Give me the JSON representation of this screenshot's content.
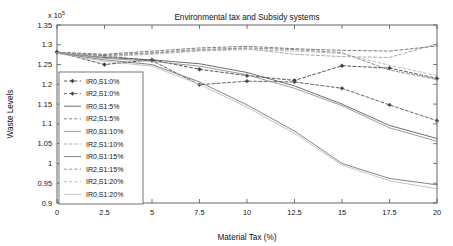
{
  "chart_data": {
    "type": "line",
    "title": "Environmental tax and Subsidy systems",
    "xlabel": "Material Tax (%)",
    "ylabel": "Waste Levels",
    "y_exponent_label": "x 10",
    "y_exponent_power": "5",
    "grid": false,
    "legend_position": "left-middle",
    "xlim": [
      0,
      20
    ],
    "ylim": [
      0.9,
      1.35
    ],
    "xticks": [
      0,
      2.5,
      5,
      7.5,
      10,
      12.5,
      15,
      17.5,
      20
    ],
    "xticklabels": [
      "0",
      "2.5",
      "5",
      "7.5",
      "10",
      "12.5",
      "15",
      "17.5",
      "20"
    ],
    "yticks": [
      0.9,
      0.95,
      1,
      1.05,
      1.1,
      1.15,
      1.2,
      1.25,
      1.3,
      1.35
    ],
    "yticklabels": [
      "0.9",
      "0.95",
      "1",
      "1.05",
      "1.1",
      "1.15",
      "1.2",
      "1.25",
      "1.3",
      "1.35"
    ],
    "x": [
      0,
      2.5,
      5,
      7.5,
      10,
      12.5,
      15,
      17.5,
      20
    ],
    "series": [
      {
        "name": "IR0,S1:0%",
        "style": "dashed-marker",
        "marker": "diamond",
        "color": "#3a3a3a",
        "values": [
          1.282,
          1.25,
          1.262,
          1.238,
          1.222,
          1.21,
          1.247,
          1.241,
          1.215
        ]
      },
      {
        "name": "IR2,S1:0%",
        "style": "dashed-marker",
        "marker": "diamond",
        "color": "#4a4a4a",
        "values": [
          1.281,
          1.272,
          1.26,
          1.199,
          1.208,
          1.206,
          1.19,
          1.148,
          1.108
        ]
      },
      {
        "name": "IR0,S1:5%",
        "style": "solid",
        "marker": "none",
        "color": "#555555",
        "values": [
          1.28,
          1.268,
          1.262,
          1.252,
          1.23,
          1.196,
          1.15,
          1.096,
          1.063
        ]
      },
      {
        "name": "IR2,S1:5%",
        "style": "dashed",
        "marker": "none",
        "color": "#666666",
        "values": [
          1.281,
          1.276,
          1.284,
          1.292,
          1.296,
          1.29,
          1.286,
          1.284,
          1.297
        ]
      },
      {
        "name": "IR0,S1:10%",
        "style": "solid",
        "marker": "none",
        "color": "#8a8a8a",
        "values": [
          1.28,
          1.266,
          1.258,
          1.246,
          1.224,
          1.19,
          1.146,
          1.09,
          1.056
        ]
      },
      {
        "name": "IR2,S1:10%",
        "style": "dashed",
        "marker": "none",
        "color": "#9a9a9a",
        "values": [
          1.28,
          1.272,
          1.278,
          1.286,
          1.29,
          1.276,
          1.27,
          1.268,
          1.302
        ]
      },
      {
        "name": "IR0,S1:15%",
        "style": "solid",
        "marker": "none",
        "color": "#6f6f6f",
        "values": [
          1.279,
          1.262,
          1.25,
          1.206,
          1.148,
          1.082,
          1.0,
          0.962,
          0.946
        ]
      },
      {
        "name": "IR2,S1:15%",
        "style": "dashed",
        "marker": "none",
        "color": "#7d7d7d",
        "values": [
          1.281,
          1.274,
          1.28,
          1.288,
          1.292,
          1.288,
          1.28,
          1.236,
          1.212
        ]
      },
      {
        "name": "IR2,S1:20%",
        "style": "dashed",
        "marker": "none",
        "color": "#b0b0b0",
        "values": [
          1.28,
          1.27,
          1.276,
          1.284,
          1.288,
          1.284,
          1.278,
          1.248,
          1.222
        ]
      },
      {
        "name": "IR0,S1:20%",
        "style": "solid",
        "marker": "none",
        "color": "#b8b8b8",
        "values": [
          1.278,
          1.258,
          1.246,
          1.2,
          1.142,
          1.076,
          0.996,
          0.956,
          0.936
        ]
      }
    ]
  }
}
